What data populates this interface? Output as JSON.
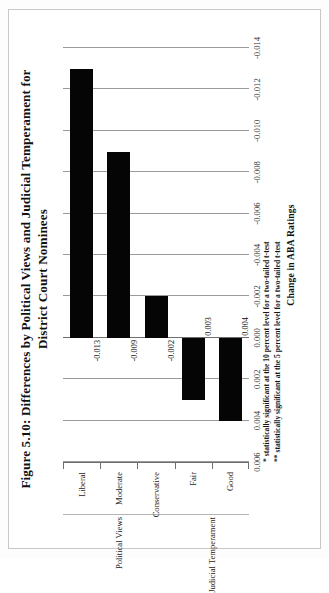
{
  "figure": {
    "title": "Figure 5.10: Differences by Political Views and Judicial Temperament for District Court Nominees",
    "notes": [
      "* statistically significant at the 10 percent level for a two-tailed t-test",
      "** statistically significant at the 5 percent level for a two-tailed t-test"
    ]
  },
  "chart_data": {
    "type": "bar",
    "orientation": "horizontal",
    "title": "Figure 5.10: Differences by Political Views and Judicial Temperament for District Court Nominees",
    "xlabel": "",
    "ylabel": "Change in ABA Ratings",
    "categories": [
      "Liberal",
      "Moderate",
      "Conservative",
      "Fair",
      "Good"
    ],
    "values": [
      -0.013,
      -0.009,
      -0.002,
      0.003,
      0.004
    ],
    "data_labels": [
      "-0.013",
      "-0.009",
      "-0.002",
      "0.003",
      "0.004"
    ],
    "groups": [
      {
        "label": "Political Views",
        "categories": [
          "Liberal",
          "Moderate",
          "Conservative"
        ]
      },
      {
        "label": "Judicial Temperament",
        "categories": [
          "Fair",
          "Good"
        ]
      }
    ],
    "value_axis_title": "Change in ABA Ratings",
    "ticks": [
      "0.006",
      "0.004",
      "0.002",
      "0.000",
      "-0.002",
      "-0.004",
      "-0.006",
      "-0.008",
      "-0.010",
      "-0.012",
      "-0.014"
    ],
    "tick_values": [
      0.006,
      0.004,
      0.002,
      0.0,
      -0.002,
      -0.004,
      -0.006,
      -0.008,
      -0.01,
      -0.012,
      -0.014
    ],
    "ylim": [
      0.006,
      -0.014
    ],
    "grid": true,
    "legend": "none",
    "bar_color": "#050505"
  },
  "colors": {
    "bar": "#050505",
    "grid": "#9a9a9a",
    "axis": "#6e6e6e",
    "page_border": "#c8c8c8",
    "text": "#111111"
  }
}
